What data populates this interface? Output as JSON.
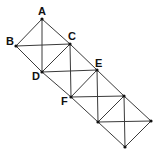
{
  "diagram": {
    "points": [
      {
        "id": "A",
        "label": "A",
        "x": 42,
        "y": 19,
        "lx": 38,
        "ly": 15
      },
      {
        "id": "B",
        "label": "B",
        "x": 16,
        "y": 46,
        "lx": 6,
        "ly": 45
      },
      {
        "id": "C",
        "label": "C",
        "x": 70,
        "y": 44,
        "lx": 68,
        "ly": 40
      },
      {
        "id": "D",
        "label": "D",
        "x": 42,
        "y": 72,
        "lx": 32,
        "ly": 80
      },
      {
        "id": "E",
        "label": "E",
        "x": 97,
        "y": 70,
        "lx": 95,
        "ly": 67
      },
      {
        "id": "F",
        "label": "F",
        "x": 71,
        "y": 97,
        "lx": 61,
        "ly": 105
      },
      {
        "id": "G",
        "label": "",
        "x": 124,
        "y": 96
      },
      {
        "id": "H",
        "label": "",
        "x": 98,
        "y": 122
      },
      {
        "id": "I",
        "label": "",
        "x": 151,
        "y": 121
      },
      {
        "id": "J",
        "label": "",
        "x": 125,
        "y": 147
      }
    ],
    "squares": [
      [
        "A",
        "C",
        "D",
        "B"
      ],
      [
        "C",
        "E",
        "F",
        "D"
      ],
      [
        "E",
        "G",
        "H",
        "F"
      ],
      [
        "G",
        "I",
        "J",
        "H"
      ]
    ],
    "labels": {
      "A": "A",
      "B": "B",
      "C": "C",
      "D": "D",
      "E": "E",
      "F": "F"
    }
  }
}
